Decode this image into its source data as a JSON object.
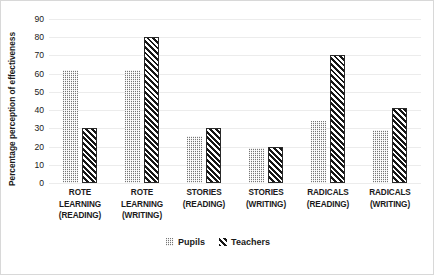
{
  "chart_data": {
    "type": "bar",
    "title": "",
    "xlabel": "",
    "ylabel": "Percentage perception of effectiveness",
    "ylim": [
      0,
      90
    ],
    "ytick_step": 10,
    "yticks": [
      90,
      80,
      70,
      60,
      50,
      40,
      30,
      20,
      10,
      0
    ],
    "grid": true,
    "legend_position": "bottom",
    "categories": [
      "ROTE LEARNING (READING)",
      "ROTE LEARNING (WRITING)",
      "STORIES (READING)",
      "STORIES (WRITING)",
      "RADICALS (READING)",
      "RADICALS (WRITING)"
    ],
    "category_lines": [
      [
        "ROTE",
        "LEARNING",
        "(READING)"
      ],
      [
        "ROTE",
        "LEARNING",
        "(WRITING)"
      ],
      [
        "STORIES",
        "(READING)"
      ],
      [
        "STORIES",
        "(WRITING)"
      ],
      [
        "RADICALS",
        "(READING)"
      ],
      [
        "RADICALS",
        "(WRITING)"
      ]
    ],
    "series": [
      {
        "name": "Pupils",
        "pattern": "dotted-light-gray",
        "color": "#c9c9c9",
        "values": [
          62,
          62,
          26,
          19,
          34,
          29
        ]
      },
      {
        "name": "Teachers",
        "pattern": "diagonal-hatch-black",
        "color": "#161616",
        "values": [
          30,
          80,
          30,
          20,
          70,
          41
        ]
      }
    ]
  },
  "legend": {
    "items": [
      {
        "label": "Pupils"
      },
      {
        "label": "Teachers"
      }
    ]
  }
}
